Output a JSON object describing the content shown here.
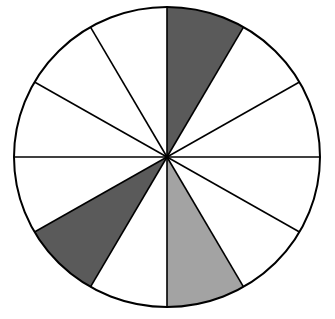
{
  "diagram": {
    "type": "fraction-circle",
    "total_sectors": 12,
    "start_angle_deg": 0,
    "direction": "clockwise",
    "center": [
      167,
      157
    ],
    "radius_x": 153,
    "radius_y": 150,
    "outline_color": "#000000",
    "background_color": "#ffffff",
    "sectors": [
      {
        "index": 0,
        "fill": "#5a5a5a",
        "shade": "dark"
      },
      {
        "index": 1,
        "fill": "#ffffff",
        "shade": "none"
      },
      {
        "index": 2,
        "fill": "#ffffff",
        "shade": "none"
      },
      {
        "index": 3,
        "fill": "#ffffff",
        "shade": "none"
      },
      {
        "index": 4,
        "fill": "#ffffff",
        "shade": "none"
      },
      {
        "index": 5,
        "fill": "#a3a3a3",
        "shade": "light"
      },
      {
        "index": 6,
        "fill": "#ffffff",
        "shade": "none"
      },
      {
        "index": 7,
        "fill": "#5a5a5a",
        "shade": "dark"
      },
      {
        "index": 8,
        "fill": "#ffffff",
        "shade": "none"
      },
      {
        "index": 9,
        "fill": "#ffffff",
        "shade": "none"
      },
      {
        "index": 10,
        "fill": "#ffffff",
        "shade": "none"
      },
      {
        "index": 11,
        "fill": "#ffffff",
        "shade": "none"
      }
    ],
    "summary": {
      "dark_shaded_count": 2,
      "light_shaded_count": 1,
      "unshaded_count": 9
    }
  }
}
